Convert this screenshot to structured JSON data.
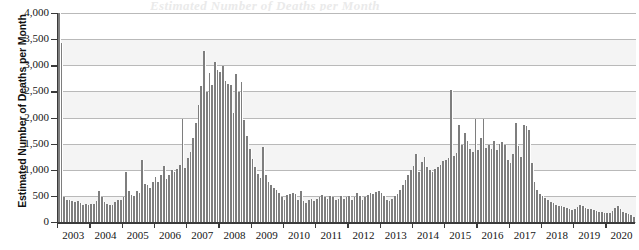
{
  "figure": {
    "clipped_title": "Estimated Number of Deaths per Month",
    "background_color": "#ffffff",
    "bar_color": "#7e7e7e",
    "axis_color": "#3a3a3a",
    "gridline_color": "#b9b9b9",
    "band_color": "#f4f4f4"
  },
  "chart_data": {
    "type": "bar",
    "title": "",
    "xlabel": "",
    "ylabel": "Estimated Number of Deaths per Month",
    "ylim": [
      0,
      4000
    ],
    "ytick_labels": [
      "4,000",
      "3,500",
      "3,000",
      "2,500",
      "2,000",
      "1,500",
      "1,000",
      "500",
      "0"
    ],
    "ytick_values": [
      4000,
      3500,
      3000,
      2500,
      2000,
      1500,
      1000,
      500,
      0
    ],
    "xtick_labels": [
      "2003",
      "2004",
      "2005",
      "2006",
      "2007",
      "2008",
      "2009",
      "2010",
      "2011",
      "2012",
      "2013",
      "2014",
      "2015",
      "2016",
      "2017",
      "2018",
      "2019",
      "2020"
    ],
    "grid": true,
    "legend": "none",
    "x_frequency": "monthly",
    "x_start": "2003-01",
    "x_end": "2020-11",
    "categories": [
      "2003-01",
      "2003-02",
      "2003-03",
      "2003-04",
      "2003-05",
      "2003-06",
      "2003-07",
      "2003-08",
      "2003-09",
      "2003-10",
      "2003-11",
      "2003-12",
      "2004-01",
      "2004-02",
      "2004-03",
      "2004-04",
      "2004-05",
      "2004-06",
      "2004-07",
      "2004-08",
      "2004-09",
      "2004-10",
      "2004-11",
      "2004-12",
      "2005-01",
      "2005-02",
      "2005-03",
      "2005-04",
      "2005-05",
      "2005-06",
      "2005-07",
      "2005-08",
      "2005-09",
      "2005-10",
      "2005-11",
      "2005-12",
      "2006-01",
      "2006-02",
      "2006-03",
      "2006-04",
      "2006-05",
      "2006-06",
      "2006-07",
      "2006-08",
      "2006-09",
      "2006-10",
      "2006-11",
      "2006-12",
      "2007-01",
      "2007-02",
      "2007-03",
      "2007-04",
      "2007-05",
      "2007-06",
      "2007-07",
      "2007-08",
      "2007-09",
      "2007-10",
      "2007-11",
      "2007-12",
      "2008-01",
      "2008-02",
      "2008-03",
      "2008-04",
      "2008-05",
      "2008-06",
      "2008-07",
      "2008-08",
      "2008-09",
      "2008-10",
      "2008-11",
      "2008-12",
      "2009-01",
      "2009-02",
      "2009-03",
      "2009-04",
      "2009-05",
      "2009-06",
      "2009-07",
      "2009-08",
      "2009-09",
      "2009-10",
      "2009-11",
      "2009-12",
      "2010-01",
      "2010-02",
      "2010-03",
      "2010-04",
      "2010-05",
      "2010-06",
      "2010-07",
      "2010-08",
      "2010-09",
      "2010-10",
      "2010-11",
      "2010-12",
      "2011-01",
      "2011-02",
      "2011-03",
      "2011-04",
      "2011-05",
      "2011-06",
      "2011-07",
      "2011-08",
      "2011-09",
      "2011-10",
      "2011-11",
      "2011-12",
      "2012-01",
      "2012-02",
      "2012-03",
      "2012-04",
      "2012-05",
      "2012-06",
      "2012-07",
      "2012-08",
      "2012-09",
      "2012-10",
      "2012-11",
      "2012-12",
      "2013-01",
      "2013-02",
      "2013-03",
      "2013-04",
      "2013-05",
      "2013-06",
      "2013-07",
      "2013-08",
      "2013-09",
      "2013-10",
      "2013-11",
      "2013-12",
      "2014-01",
      "2014-02",
      "2014-03",
      "2014-04",
      "2014-05",
      "2014-06",
      "2014-07",
      "2014-08",
      "2014-09",
      "2014-10",
      "2014-11",
      "2014-12",
      "2015-01",
      "2015-02",
      "2015-03",
      "2015-04",
      "2015-05",
      "2015-06",
      "2015-07",
      "2015-08",
      "2015-09",
      "2015-10",
      "2015-11",
      "2015-12",
      "2016-01",
      "2016-02",
      "2016-03",
      "2016-04",
      "2016-05",
      "2016-06",
      "2016-07",
      "2016-08",
      "2016-09",
      "2016-10",
      "2016-11",
      "2016-12",
      "2017-01",
      "2017-02",
      "2017-03",
      "2017-04",
      "2017-05",
      "2017-06",
      "2017-07",
      "2017-08",
      "2017-09",
      "2017-10",
      "2017-11",
      "2017-12",
      "2018-01",
      "2018-02",
      "2018-03",
      "2018-04",
      "2018-05",
      "2018-06",
      "2018-07",
      "2018-08",
      "2018-09",
      "2018-10",
      "2018-11",
      "2018-12",
      "2019-01",
      "2019-02",
      "2019-03",
      "2019-04",
      "2019-05",
      "2019-06",
      "2019-07",
      "2019-08",
      "2019-09",
      "2019-10",
      "2019-11",
      "2019-12",
      "2020-01",
      "2020-02",
      "2020-03",
      "2020-04",
      "2020-05",
      "2020-06",
      "2020-07",
      "2020-08",
      "2020-09",
      "2020-10",
      "2020-11"
    ],
    "values": [
      4050,
      3430,
      470,
      420,
      430,
      400,
      380,
      400,
      370,
      330,
      350,
      330,
      340,
      350,
      400,
      600,
      480,
      390,
      340,
      320,
      330,
      380,
      420,
      420,
      480,
      960,
      600,
      520,
      500,
      600,
      560,
      1180,
      720,
      700,
      660,
      760,
      860,
      760,
      900,
      1080,
      830,
      900,
      1000,
      960,
      1010,
      1100,
      1980,
      1030,
      1230,
      1340,
      1600,
      1900,
      2230,
      2600,
      3280,
      2490,
      2850,
      2620,
      3060,
      2900,
      2870,
      2990,
      2700,
      2640,
      2620,
      2080,
      2830,
      2480,
      2680,
      1950,
      1640,
      1400,
      1200,
      1060,
      920,
      840,
      1440,
      900,
      760,
      700,
      660,
      620,
      560,
      470,
      430,
      520,
      540,
      560,
      540,
      430,
      600,
      400,
      360,
      420,
      450,
      400,
      440,
      480,
      520,
      470,
      440,
      500,
      470,
      430,
      440,
      490,
      450,
      480,
      500,
      430,
      470,
      550,
      500,
      430,
      470,
      520,
      560,
      540,
      580,
      600,
      560,
      500,
      430,
      410,
      440,
      490,
      540,
      620,
      700,
      800,
      900,
      1000,
      1080,
      1300,
      960,
      1140,
      1250,
      1050,
      1000,
      960,
      1020,
      1060,
      1100,
      1160,
      1180,
      1220,
      2520,
      1260,
      1320,
      1860,
      1480,
      1700,
      1560,
      1400,
      1340,
      1980,
      1380,
      1600,
      1980,
      1420,
      1480,
      1400,
      1560,
      1380,
      1500,
      1540,
      1480,
      1180,
      1120,
      1300,
      1900,
      1460,
      1240,
      1860,
      1840,
      1760,
      1120,
      760,
      620,
      540,
      500,
      460,
      420,
      380,
      360,
      330,
      310,
      300,
      280,
      260,
      240,
      230,
      250,
      290,
      320,
      300,
      270,
      250,
      240,
      230,
      210,
      200,
      190,
      180,
      170,
      180,
      210,
      260,
      300,
      250,
      200,
      170,
      150,
      130,
      100
    ]
  }
}
